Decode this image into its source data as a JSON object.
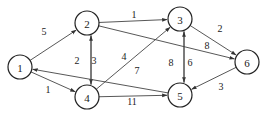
{
  "diagram": {
    "type": "directed-weighted-graph",
    "nodes": [
      {
        "id": "1",
        "label": "1",
        "x": 20,
        "y": 67
      },
      {
        "id": "2",
        "label": "2",
        "x": 87,
        "y": 23
      },
      {
        "id": "3",
        "label": "3",
        "x": 180,
        "y": 19
      },
      {
        "id": "4",
        "label": "4",
        "x": 87,
        "y": 97
      },
      {
        "id": "5",
        "label": "5",
        "x": 180,
        "y": 95
      },
      {
        "id": "6",
        "label": "6",
        "x": 247,
        "y": 62
      }
    ],
    "edges": [
      {
        "from": "1",
        "to": "2",
        "weight": "5",
        "lx": 44,
        "ly": 31,
        "off": 0
      },
      {
        "from": "1",
        "to": "4",
        "weight": "1",
        "lx": 48,
        "ly": 89,
        "off": 0
      },
      {
        "from": "2",
        "to": "3",
        "weight": "1",
        "lx": 134,
        "ly": 14,
        "off": 0
      },
      {
        "from": "2",
        "to": "4",
        "weight": "2",
        "lx": 77,
        "ly": 60,
        "off": -4
      },
      {
        "from": "4",
        "to": "2",
        "weight": "3",
        "lx": 94,
        "ly": 60,
        "off": -4
      },
      {
        "from": "4",
        "to": "3",
        "weight": "4",
        "lx": 124,
        "ly": 56,
        "off": 0
      },
      {
        "from": "2",
        "to": "6",
        "weight": "8",
        "lx": 207,
        "ly": 45,
        "off": 0
      },
      {
        "from": "3",
        "to": "6",
        "weight": "2",
        "lx": 220,
        "ly": 28,
        "off": 0
      },
      {
        "from": "3",
        "to": "5",
        "weight": "8",
        "lx": 171,
        "ly": 62,
        "off": -4
      },
      {
        "from": "5",
        "to": "3",
        "weight": "6",
        "lx": 190,
        "ly": 62,
        "off": -4
      },
      {
        "from": "5",
        "to": "1",
        "weight": "7",
        "lx": 137,
        "ly": 70,
        "off": 0
      },
      {
        "from": "4",
        "to": "5",
        "weight": "11",
        "lx": 132,
        "ly": 101,
        "off": 0
      },
      {
        "from": "6",
        "to": "5",
        "weight": "3",
        "lx": 221,
        "ly": 86,
        "off": 0
      }
    ],
    "node_radius": 12
  }
}
